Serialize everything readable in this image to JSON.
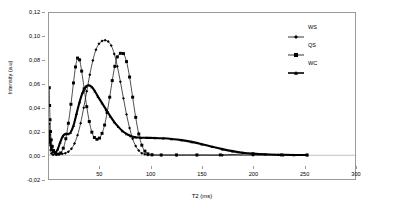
{
  "chart_data": {
    "type": "line",
    "title": "",
    "xlabel": "T2 (ms)",
    "ylabel": "Intensity (a.u)",
    "xlim": [
      0,
      300
    ],
    "ylim": [
      -0.02,
      0.12
    ],
    "grid": false,
    "legend_position": "top-right",
    "x_ticks": [
      50,
      100,
      150,
      200,
      250,
      300
    ],
    "x_tick_labels": [
      "50",
      "100",
      "150",
      "200",
      "250",
      "300"
    ],
    "y_ticks": [
      -0.02,
      0.0,
      0.02,
      0.04,
      0.06,
      0.08,
      0.1,
      0.12
    ],
    "y_tick_labels": [
      "-0,02",
      "0,00",
      "0,02",
      "0,04",
      "0,06",
      "0,08",
      "0,10",
      "0,12"
    ],
    "series": [
      {
        "name": "WS",
        "marker": "diamond",
        "color": "#000000",
        "line_width": 0.7,
        "points": [
          [
            0.3,
            0.0265
          ],
          [
            0.6,
            0.0175
          ],
          [
            1.0,
            0.0105
          ],
          [
            1.6,
            0.0045
          ],
          [
            2.4,
            0.0015
          ],
          [
            4.0,
            0.0005
          ],
          [
            7.0,
            0.0005
          ],
          [
            10.0,
            0.0008
          ],
          [
            13.0,
            0.0012
          ],
          [
            16.0,
            0.0018
          ],
          [
            19.0,
            0.003
          ],
          [
            22.0,
            0.0055
          ],
          [
            25.0,
            0.01
          ],
          [
            28.0,
            0.017
          ],
          [
            31.0,
            0.027
          ],
          [
            34.0,
            0.04
          ],
          [
            37.0,
            0.054
          ],
          [
            40.0,
            0.068
          ],
          [
            43.0,
            0.08
          ],
          [
            46.0,
            0.089
          ],
          [
            49.0,
            0.094
          ],
          [
            52.0,
            0.0963
          ],
          [
            55.0,
            0.097
          ],
          [
            58.0,
            0.096
          ],
          [
            61.0,
            0.0925
          ],
          [
            64.0,
            0.0855
          ],
          [
            67.0,
            0.075
          ],
          [
            70.0,
            0.062
          ],
          [
            73.0,
            0.048
          ],
          [
            76.0,
            0.0345
          ],
          [
            79.0,
            0.023
          ],
          [
            82.0,
            0.014
          ],
          [
            85.0,
            0.0078
          ],
          [
            88.0,
            0.004
          ],
          [
            91.0,
            0.0018
          ],
          [
            94.0,
            0.0008
          ],
          [
            97.0,
            0.0003
          ],
          [
            101.0,
            0.0001
          ],
          [
            110.0,
            0.0001
          ],
          [
            125.0,
            0.0001
          ],
          [
            145.0,
            0.0001
          ],
          [
            170.0,
            0.0001
          ],
          [
            200.0,
            0.0001
          ],
          [
            230.0,
            0.0001
          ],
          [
            253.0,
            0.0001
          ]
        ]
      },
      {
        "name": "QS",
        "marker": "square",
        "color": "#000000",
        "line_width": 0.7,
        "points": [
          [
            0.3,
            0.057
          ],
          [
            0.6,
            0.042
          ],
          [
            1.0,
            0.03
          ],
          [
            1.5,
            0.02
          ],
          [
            2.2,
            0.013
          ],
          [
            3.2,
            0.0075
          ],
          [
            4.5,
            0.004
          ],
          [
            6.5,
            0.0018
          ],
          [
            9.0,
            0.001
          ],
          [
            11.5,
            0.002
          ],
          [
            14.0,
            0.006
          ],
          [
            16.5,
            0.014
          ],
          [
            19.0,
            0.027
          ],
          [
            21.5,
            0.043
          ],
          [
            24.0,
            0.061
          ],
          [
            26.0,
            0.0745
          ],
          [
            28.0,
            0.082
          ],
          [
            30.0,
            0.0805
          ],
          [
            32.0,
            0.071
          ],
          [
            34.5,
            0.056
          ],
          [
            37.0,
            0.041
          ],
          [
            39.5,
            0.0285
          ],
          [
            42.0,
            0.0195
          ],
          [
            44.5,
            0.015
          ],
          [
            47.0,
            0.0135
          ],
          [
            49.5,
            0.0145
          ],
          [
            52.0,
            0.0185
          ],
          [
            54.5,
            0.0255
          ],
          [
            57.0,
            0.036
          ],
          [
            59.5,
            0.049
          ],
          [
            62.0,
            0.063
          ],
          [
            64.5,
            0.075
          ],
          [
            67.0,
            0.083
          ],
          [
            70.0,
            0.086
          ],
          [
            73.0,
            0.0858
          ],
          [
            76.0,
            0.079
          ],
          [
            79.0,
            0.066
          ],
          [
            82.0,
            0.049
          ],
          [
            85.0,
            0.032
          ],
          [
            88.0,
            0.018
          ],
          [
            91.0,
            0.0085
          ],
          [
            94.0,
            0.0035
          ],
          [
            97.0,
            0.0012
          ],
          [
            101.0,
            0.0005
          ],
          [
            110.0,
            0.0003
          ],
          [
            125.0,
            0.0003
          ],
          [
            145.0,
            0.0003
          ],
          [
            168.0,
            0.0003
          ],
          [
            200.0,
            0.0012
          ],
          [
            228.0,
            0.0003
          ],
          [
            253.0,
            0.0003
          ]
        ]
      },
      {
        "name": "WC",
        "marker": "triangle",
        "color": "#000000",
        "line_width": 2.1,
        "points": [
          [
            0.3,
            0.018
          ],
          [
            0.8,
            0.013
          ],
          [
            1.5,
            0.009
          ],
          [
            2.5,
            0.0055
          ],
          [
            4.0,
            0.003
          ],
          [
            6.0,
            0.0022
          ],
          [
            8.5,
            0.005
          ],
          [
            11.0,
            0.011
          ],
          [
            13.5,
            0.016
          ],
          [
            16.0,
            0.018
          ],
          [
            18.5,
            0.018
          ],
          [
            21.0,
            0.019
          ],
          [
            24.0,
            0.025
          ],
          [
            27.0,
            0.035
          ],
          [
            30.0,
            0.045
          ],
          [
            33.0,
            0.053
          ],
          [
            36.0,
            0.0578
          ],
          [
            39.0,
            0.059
          ],
          [
            42.0,
            0.0575
          ],
          [
            45.0,
            0.054
          ],
          [
            48.0,
            0.0495
          ],
          [
            52.0,
            0.044
          ],
          [
            56.0,
            0.0385
          ],
          [
            60.0,
            0.033
          ],
          [
            64.0,
            0.028
          ],
          [
            68.0,
            0.024
          ],
          [
            72.0,
            0.0205
          ],
          [
            76.0,
            0.018
          ],
          [
            80.0,
            0.0163
          ],
          [
            85.0,
            0.0152
          ],
          [
            90.0,
            0.0148
          ],
          [
            96.0,
            0.0147
          ],
          [
            104.0,
            0.0146
          ],
          [
            112.0,
            0.0143
          ],
          [
            120.0,
            0.0138
          ],
          [
            130.0,
            0.0128
          ],
          [
            140.0,
            0.0113
          ],
          [
            150.0,
            0.0094
          ],
          [
            160.0,
            0.0072
          ],
          [
            170.0,
            0.0052
          ],
          [
            180.0,
            0.0035
          ],
          [
            190.0,
            0.0022
          ],
          [
            200.0,
            0.0014
          ],
          [
            212.0,
            0.0008
          ],
          [
            225.0,
            0.0005
          ],
          [
            240.0,
            0.0003
          ],
          [
            253.0,
            0.0002
          ]
        ]
      }
    ],
    "annotations": []
  },
  "legend": {
    "entries": [
      {
        "label": "WS",
        "marker": "diamond"
      },
      {
        "label": "QS",
        "marker": "square"
      },
      {
        "label": "WC",
        "marker": "triangle"
      }
    ]
  },
  "colors": {
    "axis": "#9a9a9a",
    "series": "#000000",
    "background": "#ffffff"
  }
}
